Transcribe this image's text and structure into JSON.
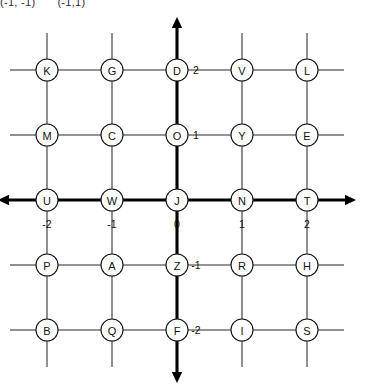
{
  "header": {
    "line": "(-1, -1)      (-1,1)",
    "left_pair": "(-1, -1)",
    "right_pair": "(-1,1)"
  },
  "chart_data": {
    "type": "scatter",
    "title": "",
    "xlabel": "",
    "ylabel": "",
    "xlim": [
      -2.6,
      2.6
    ],
    "ylim": [
      -2.6,
      2.6
    ],
    "grid": true,
    "legend": null,
    "x_ticks": [
      "-2",
      "-1",
      "0",
      "1",
      "2"
    ],
    "x_tick_values": [
      -2,
      -1,
      0,
      1,
      2
    ],
    "y_ticks": [
      "2",
      "1",
      "-1",
      "-2"
    ],
    "y_tick_values": [
      2,
      1,
      -1,
      -2
    ],
    "axes_style": "bold-arrowed-cartesian",
    "point_label_key": "letter",
    "points": [
      {
        "letter": "K",
        "x": -2,
        "y": 2
      },
      {
        "letter": "G",
        "x": -1,
        "y": 2
      },
      {
        "letter": "D",
        "x": 0,
        "y": 2
      },
      {
        "letter": "V",
        "x": 1,
        "y": 2
      },
      {
        "letter": "L",
        "x": 2,
        "y": 2
      },
      {
        "letter": "M",
        "x": -2,
        "y": 1
      },
      {
        "letter": "C",
        "x": -1,
        "y": 1
      },
      {
        "letter": "O",
        "x": 0,
        "y": 1
      },
      {
        "letter": "Y",
        "x": 1,
        "y": 1
      },
      {
        "letter": "E",
        "x": 2,
        "y": 1
      },
      {
        "letter": "U",
        "x": -2,
        "y": 0
      },
      {
        "letter": "W",
        "x": -1,
        "y": 0
      },
      {
        "letter": "J",
        "x": 0,
        "y": 0
      },
      {
        "letter": "N",
        "x": 1,
        "y": 0
      },
      {
        "letter": "T",
        "x": 2,
        "y": 0
      },
      {
        "letter": "P",
        "x": -2,
        "y": -1
      },
      {
        "letter": "A",
        "x": -1,
        "y": -1
      },
      {
        "letter": "Z",
        "x": 0,
        "y": -1
      },
      {
        "letter": "R",
        "x": 1,
        "y": -1
      },
      {
        "letter": "H",
        "x": 2,
        "y": -1
      },
      {
        "letter": "B",
        "x": -2,
        "y": -2
      },
      {
        "letter": "Q",
        "x": -1,
        "y": -2
      },
      {
        "letter": "F",
        "x": 0,
        "y": -2
      },
      {
        "letter": "I",
        "x": 1,
        "y": -2
      },
      {
        "letter": "S",
        "x": 2,
        "y": -2
      }
    ],
    "rows": [
      {
        "y": 2,
        "letters": [
          "K",
          "G",
          "D",
          "V",
          "L"
        ]
      },
      {
        "y": 1,
        "letters": [
          "M",
          "C",
          "O",
          "Y",
          "E"
        ]
      },
      {
        "y": 0,
        "letters": [
          "U",
          "W",
          "J",
          "N",
          "T"
        ]
      },
      {
        "y": -1,
        "letters": [
          "P",
          "A",
          "Z",
          "R",
          "H"
        ]
      },
      {
        "y": -2,
        "letters": [
          "B",
          "Q",
          "F",
          "I",
          "S"
        ]
      }
    ]
  },
  "colors": {
    "ink": "#111111",
    "grid_line": "#2b2b2b",
    "axis": "#000000",
    "background": "#ffffff"
  },
  "geometry": {
    "origin_px": {
      "x": 177,
      "y": 200
    },
    "spacing_px": 65,
    "node_radius_px": 11,
    "stub_px": 26
  }
}
